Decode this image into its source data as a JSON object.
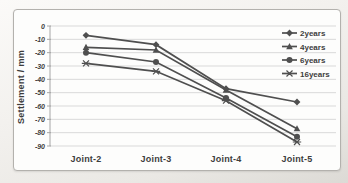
{
  "figure": {
    "page_background": "#efede9",
    "frame_background": "#fdfdfc",
    "frame_border": "#b3b1ad"
  },
  "chart_data": {
    "type": "line",
    "title": "",
    "xlabel": "",
    "ylabel": "Settlement / mm",
    "categories": [
      "Joint-2",
      "Joint-3",
      "Joint-4",
      "Joint-5"
    ],
    "y_ticks": [
      "0",
      "-10",
      "-20",
      "-30",
      "-40",
      "-50",
      "-60",
      "-70",
      "-80",
      "-90"
    ],
    "ylim": [
      -90,
      0
    ],
    "grid": true,
    "legend_position": "right-top",
    "series_color": "#4f4f4f",
    "gridline_color": "#d9d9d9",
    "axis_color": "#a6a6a6",
    "text_color": "#3d3d3d",
    "series": [
      {
        "name": "2years",
        "marker": "diamond",
        "values": [
          -7,
          -14,
          -47,
          -57
        ]
      },
      {
        "name": "4years",
        "marker": "triangle",
        "values": [
          -16,
          -18,
          -48,
          -77
        ]
      },
      {
        "name": "6years",
        "marker": "circle",
        "values": [
          -20,
          -27,
          -54,
          -83
        ]
      },
      {
        "name": "16years",
        "marker": "asterisk",
        "values": [
          -28,
          -34,
          -56,
          -87
        ]
      }
    ]
  }
}
